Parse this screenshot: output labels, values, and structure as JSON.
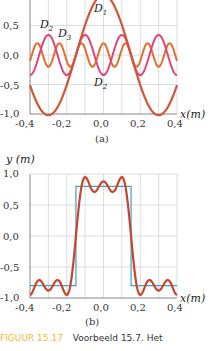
{
  "chart_data": [
    {
      "type": "line",
      "panel": "(a)",
      "xlabel": "x(m)",
      "ylabel": "",
      "xlim": [
        -0.4,
        0.4
      ],
      "ylim": [
        -1.0,
        0.9
      ],
      "xticks": [
        "-0,4",
        "-0,2",
        "0,0",
        "0,2",
        "0,4"
      ],
      "yticks": [
        "0,5",
        "0,0",
        "-0,5",
        "-1,0"
      ],
      "grid": true,
      "series": [
        {
          "name": "D1",
          "amplitude": 1.02,
          "harmonic": 1,
          "period": 0.6,
          "color": "#d2553a"
        },
        {
          "name": "D2",
          "amplitude": -0.34,
          "harmonic": 3,
          "period": 0.6,
          "color": "#e0457a"
        },
        {
          "name": "D3",
          "amplitude": 0.2,
          "harmonic": 5,
          "period": 0.6,
          "color": "#e0662c"
        }
      ],
      "annotations": [
        "D1",
        "D2",
        "D3",
        "D2"
      ]
    },
    {
      "type": "line",
      "panel": "(b)",
      "xlabel": "x(m)",
      "ylabel": "y (m)",
      "xlim": [
        -0.4,
        0.4
      ],
      "ylim": [
        -1.0,
        1.0
      ],
      "xticks": [
        "-0,4",
        "-0,2",
        "0,0",
        "0,2",
        "0,4"
      ],
      "yticks": [
        "1,0",
        "0,5",
        "0,0",
        "-0,5",
        "-1,0"
      ],
      "grid": true,
      "series": [
        {
          "name": "square wave",
          "amplitude": 0.8,
          "high_range": [
            -0.15,
            0.15
          ],
          "color": "#3aa3c9"
        },
        {
          "name": "sum D1+D2+D3",
          "color": "#c8442b"
        }
      ]
    }
  ],
  "labels": {
    "panel_a": "(a)",
    "panel_b": "(b)",
    "xlabel": "x(m)",
    "ylabel_b": "y (m)",
    "d": "D",
    "d1_sub": "1",
    "d2_sub": "2",
    "d3_sub": "3"
  },
  "caption": {
    "number": "FIGUUR 15.17",
    "text": "Voorbeeld 15.7. Het"
  }
}
